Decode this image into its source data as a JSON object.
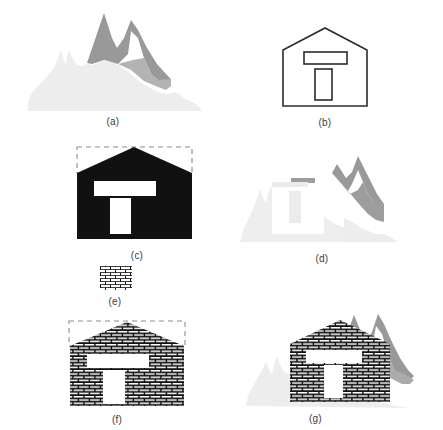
{
  "figure": {
    "background_color": "#ffffff",
    "colors": {
      "mountain_dark": "#999999",
      "mountain_light": "#ededed",
      "mountain_mid": "#b0b0b0",
      "ink": "#1a1a1a",
      "outline": "#2b2b2b",
      "dashed": "#8c8c8c",
      "white": "#ffffff",
      "caption_text": "#3a3a3a"
    }
  },
  "panels": [
    {
      "id": "a",
      "caption": "(a)",
      "content_name": "mountain-scene-original",
      "description": "Grayscale mountain landscape: dark gray twin peaks behind a light gray ridge foreground"
    },
    {
      "id": "b",
      "caption": "(b)",
      "content_name": "house-outline",
      "description": "Line-drawing outline of a house with a horizontal window band and a vertical door"
    },
    {
      "id": "c",
      "caption": "(c)",
      "content_name": "house-solid-black-with-bounding-box",
      "description": "Solid black house silhouette with white window and door, dashed bounding box over the roof"
    },
    {
      "id": "d",
      "caption": "(d)",
      "content_name": "mountain-scene-eroded",
      "description": "Mountain scene eroded by the house structuring element leaving a T-shaped residue"
    },
    {
      "id": "e",
      "caption": "(e)",
      "content_name": "brick-texture-swatch",
      "description": "Small rectangular swatch of brick texture"
    },
    {
      "id": "f",
      "caption": "(f)",
      "content_name": "house-brick-textured-with-bounding-box",
      "description": "House silhouette filled with brick texture, dashed bounding box over the roof"
    },
    {
      "id": "g",
      "caption": "(g)",
      "content_name": "brick-house-composited-on-mountains",
      "description": "Brick-textured house composited onto the mountain landscape"
    }
  ]
}
